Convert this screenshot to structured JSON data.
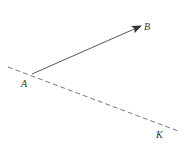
{
  "diagram": {
    "line_color": "#444444",
    "dashed_line": {
      "x1": 8,
      "y1": 67,
      "x2": 178,
      "y2": 131,
      "label": "K"
    },
    "vector": {
      "from": "A",
      "to": "B",
      "x1": 32,
      "y1": 74,
      "x2": 141,
      "y2": 26
    },
    "points": [
      {
        "name": "A",
        "x": 21,
        "y": 87
      },
      {
        "name": "B",
        "x": 144,
        "y": 30
      },
      {
        "name": "K",
        "x": 156,
        "y": 138
      }
    ]
  }
}
